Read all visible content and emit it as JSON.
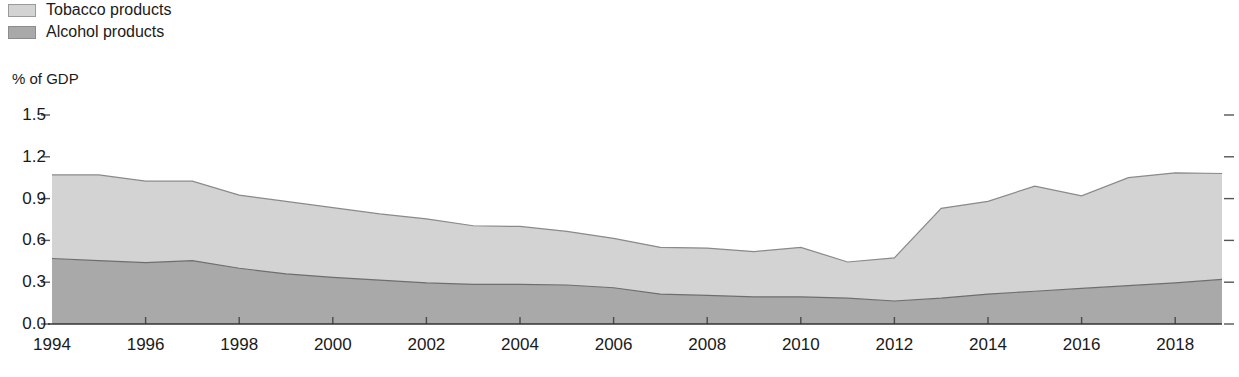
{
  "legend": {
    "position": "top-left",
    "items": [
      {
        "label": "Tobacco products",
        "color": "#d3d3d3",
        "border": "#9a9a9a"
      },
      {
        "label": "Alcohol products",
        "color": "#a9a9a9",
        "border": "#8c8c8c"
      }
    ]
  },
  "chart_data": {
    "type": "area",
    "stacked": true,
    "title": "",
    "subtitle": "",
    "xlabel": "",
    "ylabel": "% of GDP",
    "ylim": [
      0.0,
      1.5
    ],
    "xlim": [
      1994,
      2019
    ],
    "grid": false,
    "y_ticks": [
      "1.5",
      "1.2",
      "0.9",
      "0.6",
      "0.3",
      "0.0"
    ],
    "y_tick_values": [
      1.5,
      1.2,
      0.9,
      0.6,
      0.3,
      0.0
    ],
    "x_ticks": [
      "1994",
      "1996",
      "1998",
      "2000",
      "2002",
      "2004",
      "2006",
      "2008",
      "2010",
      "2012",
      "2014",
      "2016",
      "2018"
    ],
    "x_tick_values": [
      1994,
      1996,
      1998,
      2000,
      2002,
      2004,
      2006,
      2008,
      2010,
      2012,
      2014,
      2016,
      2018
    ],
    "x": [
      1994,
      1995,
      1996,
      1997,
      1998,
      1999,
      2000,
      2001,
      2002,
      2003,
      2004,
      2005,
      2006,
      2007,
      2008,
      2009,
      2010,
      2011,
      2012,
      2013,
      2014,
      2015,
      2016,
      2017,
      2018,
      2019
    ],
    "series": [
      {
        "name": "Alcohol products",
        "color": "#a9a9a9",
        "border": "#6e6e6e",
        "values": [
          0.47,
          0.455,
          0.44,
          0.455,
          0.4,
          0.36,
          0.335,
          0.315,
          0.295,
          0.285,
          0.285,
          0.28,
          0.26,
          0.215,
          0.205,
          0.195,
          0.195,
          0.185,
          0.165,
          0.185,
          0.215,
          0.235,
          0.255,
          0.275,
          0.295,
          0.32
        ]
      },
      {
        "name": "Tobacco products",
        "color": "#d3d3d3",
        "border": "#8a8a8a",
        "values": [
          0.6,
          0.615,
          0.585,
          0.57,
          0.525,
          0.52,
          0.5,
          0.475,
          0.46,
          0.42,
          0.415,
          0.385,
          0.355,
          0.335,
          0.34,
          0.325,
          0.355,
          0.26,
          0.31,
          0.645,
          0.665,
          0.755,
          0.665,
          0.775,
          0.79,
          0.76
        ]
      }
    ],
    "totals": [
      1.07,
      1.07,
      1.025,
      1.025,
      0.925,
      0.88,
      0.835,
      0.79,
      0.755,
      0.705,
      0.7,
      0.665,
      0.615,
      0.55,
      0.545,
      0.52,
      0.55,
      0.445,
      0.475,
      0.83,
      0.88,
      0.99,
      0.92,
      1.05,
      1.085,
      1.08
    ]
  },
  "axis": {
    "left_tick_marks": true,
    "right_tick_marks": true,
    "baseline_color": "#333333"
  }
}
